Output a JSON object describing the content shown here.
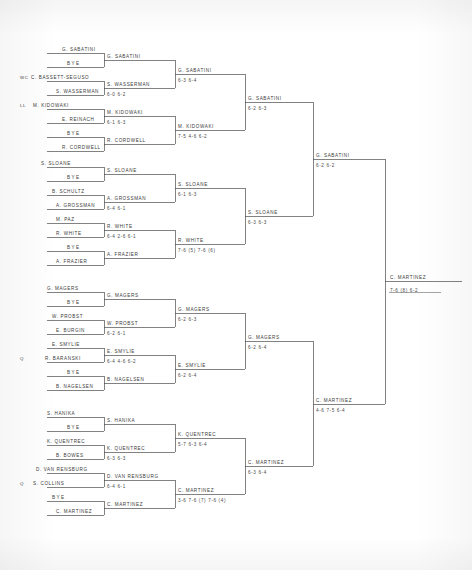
{
  "document": {
    "type": "tennis-tournament-draw",
    "champion": "C. MARTINEZ",
    "final_score": "7-6 (8) 6-2"
  },
  "round1": [
    {
      "seed": "",
      "name": "G. SABATINI"
    },
    {
      "seed": "",
      "name": "BYE"
    },
    {
      "seed": "WC",
      "name": "C. BASSETT-SEGUSO"
    },
    {
      "seed": "",
      "name": "S. WASSERMAN"
    },
    {
      "seed": "LL",
      "name": "M. KIDOWAKI"
    },
    {
      "seed": "",
      "name": "E. REINACH"
    },
    {
      "seed": "",
      "name": "BYE"
    },
    {
      "seed": "",
      "name": "R. CORDWELL"
    },
    {
      "seed": "",
      "name": "S. SLOANE"
    },
    {
      "seed": "",
      "name": "BYE"
    },
    {
      "seed": "",
      "name": "B. SCHULTZ"
    },
    {
      "seed": "",
      "name": "A. GROSSMAN"
    },
    {
      "seed": "",
      "name": "M. PAZ"
    },
    {
      "seed": "",
      "name": "R. WHITE"
    },
    {
      "seed": "",
      "name": "BYE"
    },
    {
      "seed": "",
      "name": "A. FRAZIER"
    },
    {
      "seed": "",
      "name": "G. MAGERS"
    },
    {
      "seed": "",
      "name": "BYE"
    },
    {
      "seed": "",
      "name": "W. PROBST"
    },
    {
      "seed": "",
      "name": "E. BURGIN"
    },
    {
      "seed": "",
      "name": "E. SMYLIE"
    },
    {
      "seed": "Q",
      "name": "R. BARANSKI"
    },
    {
      "seed": "",
      "name": "BYE"
    },
    {
      "seed": "",
      "name": "B. NAGELSEN"
    },
    {
      "seed": "",
      "name": "S. HANIKA"
    },
    {
      "seed": "",
      "name": "BYE"
    },
    {
      "seed": "",
      "name": "K. QUENTREC"
    },
    {
      "seed": "",
      "name": "B. BOWES"
    },
    {
      "seed": "",
      "name": "D. VAN RENSBURG"
    },
    {
      "seed": "Q",
      "name": "S. COLLINS"
    },
    {
      "seed": "",
      "name": "BYE"
    },
    {
      "seed": "",
      "name": "C. MARTINEZ"
    }
  ],
  "round2": [
    {
      "name": "G. SABATINI",
      "score": ""
    },
    {
      "name": "S. WASSERMAN",
      "score": "6-0 6-2"
    },
    {
      "name": "M. KIDOWAKI",
      "score": "6-1 6-3"
    },
    {
      "name": "R. CORDWELL",
      "score": ""
    },
    {
      "name": "S. SLOANE",
      "score": ""
    },
    {
      "name": "A. GROSSMAN",
      "score": "6-4 6-1"
    },
    {
      "name": "R. WHITE",
      "score": "6-4 2-6 6-1"
    },
    {
      "name": "A. FRAZIER",
      "score": ""
    },
    {
      "name": "G. MAGERS",
      "score": ""
    },
    {
      "name": "W. PROBST",
      "score": "6-2 6-1"
    },
    {
      "name": "E. SMYLIE",
      "score": "6-4 4-6 6-2"
    },
    {
      "name": "B. NAGELSEN",
      "score": ""
    },
    {
      "name": "S. HANIKA",
      "score": ""
    },
    {
      "name": "K. QUENTREC",
      "score": "6-3 6-3"
    },
    {
      "name": "D. VAN RENSBURG",
      "score": "6-4 6-1"
    },
    {
      "name": "C. MARTINEZ",
      "score": ""
    }
  ],
  "round3": [
    {
      "name": "G. SABATINI",
      "score": "6-3 6-4"
    },
    {
      "name": "M. KIDOWAKI",
      "score": "7-5 4-6 6-2"
    },
    {
      "name": "S. SLOANE",
      "score": "6-1 6-3"
    },
    {
      "name": "R. WHITE",
      "score": "7-6 (5) 7-6 (6)"
    },
    {
      "name": "G. MAGERS",
      "score": "6-2 6-3"
    },
    {
      "name": "E. SMYLIE",
      "score": "6-2 6-4"
    },
    {
      "name": "K. QUENTREC",
      "score": "5-7 6-3 6-4"
    },
    {
      "name": "C. MARTINEZ",
      "score": "3-6 7-6 (7) 7-6 (4)"
    }
  ],
  "quarterfinals": [
    {
      "name": "G. SABATINI",
      "score": "6-2 6-3"
    },
    {
      "name": "S. SLOANE",
      "score": "6-3 6-3"
    },
    {
      "name": "G. MAGERS",
      "score": "6-2 6-4"
    },
    {
      "name": "C. MARTINEZ",
      "score": "6-3 6-4"
    }
  ],
  "semifinals": [
    {
      "name": "G. SABATINI",
      "score": "6-2 6-2"
    },
    {
      "name": "C. MARTINEZ",
      "score": "4-6 7-5 6-4"
    }
  ],
  "final": {
    "name": "C. MARTINEZ",
    "score": "7-6 (8) 6-2"
  }
}
